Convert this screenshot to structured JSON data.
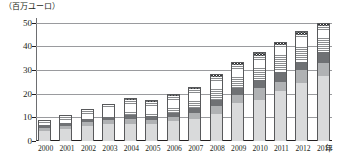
{
  "axis": {
    "y_unit_label": "（百万ユーロ）",
    "x_unit_label": "年",
    "y_ticks": [
      "0",
      "10",
      "20",
      "30",
      "40",
      "50"
    ]
  },
  "chart_data": {
    "type": "bar",
    "stacked": true,
    "title": "",
    "subtitle": "",
    "xlabel": "年",
    "ylabel": "（百万ユーロ）",
    "ylim": [
      0,
      52
    ],
    "yticks": [
      0,
      10,
      20,
      30,
      40,
      50
    ],
    "grid": true,
    "legend": "none",
    "categories": [
      "2000",
      "2001",
      "2002",
      "2003",
      "2004",
      "2005",
      "2006",
      "2007",
      "2008",
      "2009",
      "2010",
      "2011",
      "2012",
      "2013"
    ],
    "series": [
      {
        "name": "segment-1",
        "pattern": "solid-light-gray",
        "color": "#d9dadb",
        "values": [
          4.3,
          5.0,
          6.5,
          7.0,
          7.3,
          7.0,
          8.3,
          9.5,
          11.5,
          16.0,
          17.5,
          21.0,
          24.5,
          27.5
        ]
      },
      {
        "name": "segment-2",
        "pattern": "solid-medium-gray",
        "color": "#b0b2b4",
        "values": [
          1.3,
          1.5,
          1.5,
          1.7,
          2.0,
          2.0,
          2.0,
          2.5,
          3.5,
          3.5,
          5.0,
          4.0,
          5.5,
          5.5
        ]
      },
      {
        "name": "segment-3",
        "pattern": "solid-dark-gray",
        "color": "#6f7174",
        "values": [
          1.0,
          1.3,
          1.3,
          1.5,
          1.7,
          1.7,
          1.7,
          1.8,
          2.5,
          3.0,
          3.5,
          4.0,
          3.5,
          4.5
        ]
      },
      {
        "name": "segment-4",
        "pattern": "horizontal-stripes",
        "color": "#8a8c8e",
        "values": [
          2.3,
          3.2,
          4.2,
          5.3,
          6.5,
          6.0,
          7.0,
          8.2,
          9.5,
          9.5,
          10.0,
          11.5,
          11.5,
          11.0
        ]
      },
      {
        "name": "segment-5",
        "pattern": "crosshatch",
        "color": "#76787a",
        "values": [
          0.0,
          0.0,
          0.0,
          0.0,
          0.5,
          0.5,
          0.8,
          1.0,
          1.2,
          1.5,
          1.5,
          1.5,
          1.5,
          1.5
        ]
      }
    ],
    "totals": [
      8.9,
      11.0,
      13.5,
      15.5,
      18.0,
      17.2,
      19.8,
      23.0,
      28.2,
      33.5,
      37.5,
      42.0,
      46.5,
      50.0
    ]
  }
}
